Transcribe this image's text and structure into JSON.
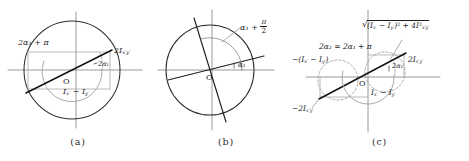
{
  "figure": {
    "kind": "mohr-circle-triptych",
    "panels": [
      {
        "id": "a",
        "caption": "(a)",
        "origin_label": "O",
        "labels": {
          "angle_outer": "2α₁ + π",
          "angle_inner": "2α₁",
          "vertical_segment": "2I",
          "vertical_segment_sub": "x′y′",
          "horizontal_segment": "I",
          "horizontal_segment_sub1": "x′",
          "horizontal_segment_minus": " − I",
          "horizontal_segment_sub2": "y′"
        }
      },
      {
        "id": "b",
        "caption": "(b)",
        "origin_label": "O",
        "labels": {
          "angle_major": "α₁ + ",
          "angle_major_num": "π",
          "angle_major_den": "2",
          "angle_minor": "α₁"
        }
      },
      {
        "id": "c",
        "caption": "(c)",
        "origin_label": "O",
        "labels": {
          "radius_expr_open": "(I",
          "radius_expr_sub1": "x′",
          "radius_expr_mid": " − I",
          "radius_expr_sub2": "y′",
          "radius_expr_close": ")",
          "radius_expr_sq": "2",
          "radius_expr_plus": " + 4I",
          "radius_expr_sub3": "x′y′",
          "radius_expr_sq2": "2",
          "angle_relation_left": "2α₂ = 2α₁ + π",
          "angle_inner": "2α₁",
          "neg_diff": "−(I",
          "neg_diff_sub1": "x′",
          "neg_diff_mid": " − I",
          "neg_diff_sub2": "y′",
          "neg_diff_close": ")",
          "pos_shear": "2I",
          "pos_shear_sub": "x′y′",
          "neg_shear": "−2I",
          "neg_shear_sub": "x′y′",
          "pos_diff": "I",
          "pos_diff_sub1": "x′",
          "pos_diff_mid": " − I",
          "pos_diff_sub2": "y′"
        }
      }
    ],
    "colors": {
      "stroke": "#3a3a3a",
      "stroke_heavy": "#1a1a1a",
      "stroke_light": "#9a9a9a",
      "dashed": "#8c8c8c",
      "background": "#ffffff",
      "text": "#1c1c1c"
    }
  }
}
